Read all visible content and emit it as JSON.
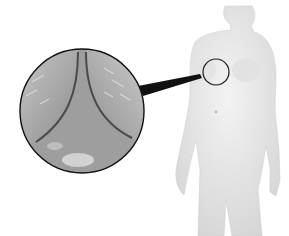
{
  "illustration": {
    "subject": "anatomical-torso-figure",
    "style": "grayscale-medical-illustration",
    "callout": {
      "shape": "circle",
      "target_region": "chest-skin-fold",
      "description": "magnified view of skin fold"
    },
    "colors": {
      "background": "#ffffff",
      "figure_fill": "#ececec",
      "figure_shade": "#dcdcdc",
      "outline": "#1a1a1a",
      "inset_light": "#bdbdbd",
      "inset_dark": "#7a7a7a"
    }
  }
}
